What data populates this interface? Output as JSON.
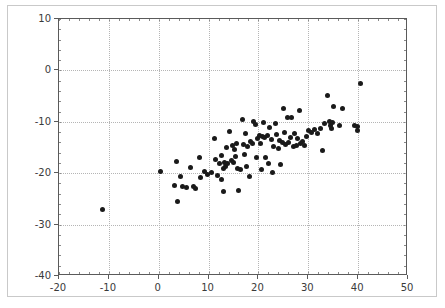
{
  "chart_data": {
    "type": "scatter",
    "title": "",
    "xlabel": "",
    "ylabel": "",
    "xlim": [
      -20,
      50
    ],
    "ylim": [
      -40,
      10
    ],
    "xticks": [
      -20,
      -10,
      0,
      10,
      20,
      30,
      40,
      50
    ],
    "yticks": [
      10,
      0,
      -10,
      -20,
      -30,
      -40
    ],
    "xtick_labels": [
      "-20",
      "-10",
      "0",
      "10",
      "20",
      "30",
      "40",
      "50"
    ],
    "ytick_labels": [
      "10",
      "0",
      "-10",
      "-20",
      "-30",
      "-40"
    ],
    "grid": true,
    "grid_style": "dotted",
    "legend": null,
    "marker": "circle",
    "marker_color": "#1a1a1a",
    "marker_size": 5,
    "n_points": 104,
    "points": [
      [
        -11.2,
        -27.1
      ],
      [
        0.4,
        -19.7
      ],
      [
        3.2,
        -22.3
      ],
      [
        3.5,
        -17.8
      ],
      [
        3.8,
        -25.5
      ],
      [
        4.3,
        -20.6
      ],
      [
        4.8,
        -22.6
      ],
      [
        5.6,
        -22.7
      ],
      [
        6.3,
        -18.9
      ],
      [
        6.9,
        -22.6
      ],
      [
        7.4,
        -22.9
      ],
      [
        8.1,
        -16.9
      ],
      [
        8.4,
        -20.8
      ],
      [
        9.2,
        -19.6
      ],
      [
        9.8,
        -20.2
      ],
      [
        10.6,
        -19.9
      ],
      [
        11.2,
        -13.3
      ],
      [
        11.4,
        -17.3
      ],
      [
        11.8,
        -20.5
      ],
      [
        12.2,
        -18.1
      ],
      [
        12.5,
        -16.5
      ],
      [
        12.6,
        -21.2
      ],
      [
        12.9,
        -19.0
      ],
      [
        13.0,
        -23.6
      ],
      [
        13.2,
        -17.9
      ],
      [
        13.4,
        -18.6
      ],
      [
        13.6,
        -15.0
      ],
      [
        13.8,
        -18.2
      ],
      [
        14.2,
        -11.9
      ],
      [
        14.5,
        -17.6
      ],
      [
        14.8,
        -14.7
      ],
      [
        15.0,
        -18.0
      ],
      [
        15.2,
        -15.3
      ],
      [
        15.4,
        -16.7
      ],
      [
        15.6,
        -14.2
      ],
      [
        15.8,
        -19.0
      ],
      [
        16.1,
        -23.3
      ],
      [
        16.4,
        -19.2
      ],
      [
        16.8,
        -9.6
      ],
      [
        17.0,
        -14.5
      ],
      [
        17.2,
        -16.3
      ],
      [
        17.4,
        -12.2
      ],
      [
        17.6,
        -18.6
      ],
      [
        17.9,
        -14.9
      ],
      [
        18.2,
        -20.6
      ],
      [
        18.5,
        -13.8
      ],
      [
        18.8,
        -14.3
      ],
      [
        19.1,
        -9.9
      ],
      [
        19.4,
        -10.5
      ],
      [
        19.6,
        -17.0
      ],
      [
        19.9,
        -13.3
      ],
      [
        20.2,
        -12.6
      ],
      [
        20.4,
        -14.2
      ],
      [
        20.6,
        -19.3
      ],
      [
        20.8,
        -12.9
      ],
      [
        21.0,
        -10.1
      ],
      [
        21.3,
        -13.0
      ],
      [
        21.5,
        -16.9
      ],
      [
        21.8,
        -12.7
      ],
      [
        22.0,
        -18.2
      ],
      [
        22.3,
        -11.2
      ],
      [
        22.6,
        -13.5
      ],
      [
        22.9,
        -19.9
      ],
      [
        23.1,
        -14.8
      ],
      [
        23.4,
        -10.3
      ],
      [
        23.7,
        -12.4
      ],
      [
        24.0,
        -15.2
      ],
      [
        24.2,
        -13.7
      ],
      [
        24.5,
        -18.3
      ],
      [
        24.8,
        -14.1
      ],
      [
        25.0,
        -7.4
      ],
      [
        25.2,
        -12.0
      ],
      [
        25.5,
        -14.4
      ],
      [
        25.8,
        -9.2
      ],
      [
        26.1,
        -14.0
      ],
      [
        26.4,
        -13.1
      ],
      [
        26.7,
        -9.1
      ],
      [
        27.0,
        -14.9
      ],
      [
        27.3,
        -12.3
      ],
      [
        27.6,
        -14.6
      ],
      [
        27.9,
        -13.3
      ],
      [
        28.2,
        -7.8
      ],
      [
        28.5,
        -14.2
      ],
      [
        28.8,
        -13.9
      ],
      [
        29.2,
        -14.7
      ],
      [
        29.6,
        -12.8
      ],
      [
        30.1,
        -11.7
      ],
      [
        30.6,
        -12.1
      ],
      [
        31.2,
        -11.5
      ],
      [
        31.8,
        -12.2
      ],
      [
        32.4,
        -11.3
      ],
      [
        32.9,
        -15.6
      ],
      [
        33.3,
        -10.4
      ],
      [
        33.8,
        -4.8
      ],
      [
        34.2,
        -9.9
      ],
      [
        34.5,
        -10.8
      ],
      [
        34.6,
        -11.4
      ],
      [
        34.8,
        -10.1
      ],
      [
        35.0,
        -7.1
      ],
      [
        36.3,
        -10.8
      ],
      [
        36.8,
        -7.5
      ],
      [
        39.3,
        -10.7
      ],
      [
        39.8,
        -10.9
      ],
      [
        39.9,
        -11.6
      ],
      [
        40.4,
        -2.6
      ]
    ]
  }
}
